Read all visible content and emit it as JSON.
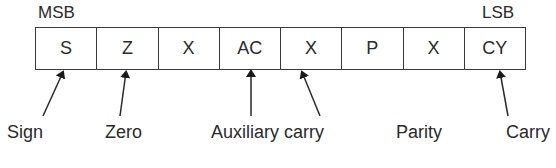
{
  "diagram": {
    "msb_label": "MSB",
    "lsb_label": "LSB",
    "bits": [
      {
        "label": "S"
      },
      {
        "label": "Z"
      },
      {
        "label": "X"
      },
      {
        "label": "AC"
      },
      {
        "label": "X"
      },
      {
        "label": "P"
      },
      {
        "label": "X"
      },
      {
        "label": "CY"
      }
    ],
    "flags": [
      {
        "name": "Sign",
        "bit": "S"
      },
      {
        "name": "Zero",
        "bit": "Z"
      },
      {
        "name": "Auxiliary carry",
        "bit": "AC"
      },
      {
        "name": "Parity",
        "bit": "P"
      },
      {
        "name": "Carry",
        "bit": "CY"
      }
    ]
  }
}
